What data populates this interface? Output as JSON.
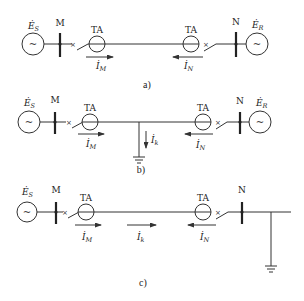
{
  "diagrams": [
    {
      "caption": "a)",
      "source_left": {
        "symbol": "Ė",
        "sub": "S",
        "glyph": "~"
      },
      "bus_left": "M",
      "ct_left": "TA",
      "ct_right": "TA",
      "bus_right": "N",
      "source_right": {
        "symbol": "Ė",
        "sub": "R",
        "glyph": "~"
      },
      "switch_mark": "×",
      "currents": [
        {
          "symbol": "İ",
          "sub": "M",
          "direction": "right"
        },
        {
          "symbol": "İ",
          "sub": "N",
          "direction": "left"
        }
      ]
    },
    {
      "caption": "b)",
      "source_left": {
        "symbol": "Ė",
        "sub": "S",
        "glyph": "~"
      },
      "bus_left": "M",
      "ct_left": "TA",
      "ct_right": "TA",
      "bus_right": "N",
      "source_right": {
        "symbol": "Ė",
        "sub": "R",
        "glyph": "~"
      },
      "switch_mark": "×",
      "fault": {
        "location": "internal",
        "symbol": "İ",
        "sub": "k",
        "direction": "down"
      },
      "currents": [
        {
          "symbol": "İ",
          "sub": "M",
          "direction": "right"
        },
        {
          "symbol": "İ",
          "sub": "N",
          "direction": "left"
        }
      ]
    },
    {
      "caption": "c)",
      "source_left": {
        "symbol": "Ė",
        "sub": "S",
        "glyph": "~"
      },
      "bus_left": "M",
      "ct_left": "TA",
      "ct_right": "TA",
      "bus_right": "N",
      "switch_mark": "×",
      "fault": {
        "location": "external",
        "symbol": "İ",
        "sub": "k",
        "direction": "right"
      },
      "currents": [
        {
          "symbol": "İ",
          "sub": "M",
          "direction": "right"
        },
        {
          "symbol": "İ",
          "sub": "k",
          "direction": "right"
        },
        {
          "symbol": "İ",
          "sub": "N",
          "direction": "left"
        }
      ]
    }
  ]
}
